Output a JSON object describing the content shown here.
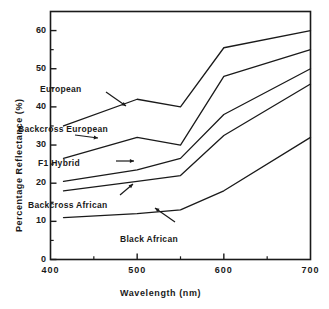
{
  "chart_data": {
    "type": "line",
    "title": "",
    "xlabel": "Wavelength  (nm)",
    "ylabel": "Percentage  Reflectance  (%)",
    "xlim": [
      400,
      700
    ],
    "ylim": [
      0,
      65
    ],
    "xticks": [
      400,
      500,
      600,
      700
    ],
    "xtick_labels": [
      "400",
      "500",
      "600",
      "700"
    ],
    "yticks": [
      0,
      10,
      20,
      30,
      40,
      50,
      60
    ],
    "ytick_labels": [
      "0",
      "10",
      "20",
      "30",
      "40",
      "50",
      "60"
    ],
    "x_minor_ticks": [
      450,
      550,
      650
    ],
    "y_minor_ticks": [
      5,
      15,
      25,
      35,
      45,
      55
    ],
    "grid": false,
    "legend": "inline-annotations",
    "x": [
      415,
      500,
      550,
      600,
      700
    ],
    "series": [
      {
        "name": "European",
        "values": [
          35.0,
          42.0,
          40.0,
          55.5,
          60.0
        ],
        "color": "#1a1a1a"
      },
      {
        "name": "Backcross European",
        "values": [
          26.5,
          32.0,
          30.0,
          48.0,
          55.0
        ],
        "color": "#1a1a1a"
      },
      {
        "name": "F1 Hybrid",
        "values": [
          20.5,
          23.5,
          26.5,
          38.0,
          50.0
        ],
        "color": "#1a1a1a"
      },
      {
        "name": "Backcross African",
        "values": [
          18.0,
          20.5,
          22.0,
          32.5,
          46.0
        ],
        "color": "#1a1a1a"
      },
      {
        "name": "Black African",
        "values": [
          11.0,
          12.0,
          13.0,
          18.0,
          32.0
        ],
        "color": "#1a1a1a"
      }
    ],
    "annotations": [
      {
        "text": "European",
        "x": 40,
        "y": 84,
        "arrow_from": [
          106,
          92
        ],
        "arrow_to": [
          126,
          106
        ]
      },
      {
        "text": "Backcross  European",
        "x": 18,
        "y": 124,
        "arrow_from": [
          75,
          135
        ],
        "arrow_to": [
          98,
          138
        ]
      },
      {
        "text": "F1  Hybrid",
        "x": 38,
        "y": 158,
        "arrow_from": [
          116,
          161
        ],
        "arrow_to": [
          134,
          161
        ]
      },
      {
        "text": "Backcross  African",
        "x": 28,
        "y": 200,
        "arrow_from": [
          120,
          195
        ],
        "arrow_to": [
          133,
          184
        ]
      },
      {
        "text": "Black  African",
        "x": 120,
        "y": 234,
        "arrow_from": [
          175,
          222
        ],
        "arrow_to": [
          155,
          208
        ]
      }
    ]
  },
  "axes": {
    "frame_color": "#1a1a1a"
  }
}
